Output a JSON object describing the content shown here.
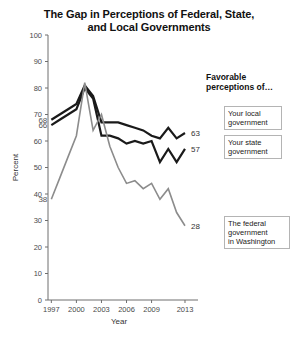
{
  "title": "The Gap in Perceptions of Federal, State, and Local Governments",
  "title_line1": "The Gap in Perceptions of Federal, State,",
  "title_line2": "and Local Governments",
  "legend": {
    "heading_line1": "Favorable",
    "heading_line2": "perceptions of…",
    "local_line1": "Your local",
    "local_line2": "government",
    "state_line1": "Your state",
    "state_line2": "government",
    "federal_line1": "The federal",
    "federal_line2": "government",
    "federal_line3": "in Washington"
  },
  "colors": {
    "local": "#1a1a1a",
    "state": "#1a1a1a",
    "federal": "#8c8c8c",
    "axis": "#6e6e6e",
    "legend_border": "#b4b4b4",
    "text": "#111111"
  },
  "annotations": {
    "start_local": "68",
    "start_state": "66",
    "start_federal": "38",
    "end_local": "63",
    "end_state": "57",
    "end_federal": "28"
  },
  "chart_data": {
    "type": "line",
    "title": "The Gap in Perceptions of Federal, State, and Local Governments",
    "xlabel": "Year",
    "ylabel": "Percent",
    "xlim": [
      1996,
      2014
    ],
    "ylim": [
      0,
      100
    ],
    "ytick_values": [
      0,
      10,
      20,
      30,
      40,
      50,
      60,
      70,
      80,
      90,
      100
    ],
    "xtick_values": [
      1997,
      2000,
      2003,
      2006,
      2009,
      2013
    ],
    "xtick_labels": [
      "1997",
      "2000",
      "2003",
      "2006",
      "2009",
      "2013"
    ],
    "grid": false,
    "legend_position": "right-callout-boxes",
    "series": [
      {
        "name": "Your local government",
        "color": "#1a1a1a",
        "start_label": "68",
        "end_label": "63",
        "x": [
          1997,
          1998,
          1999,
          2000,
          2001,
          2002,
          2003,
          2004,
          2005,
          2006,
          2007,
          2008,
          2009,
          2010,
          2011,
          2012,
          2013
        ],
        "values": [
          68,
          70,
          72,
          74,
          81,
          77,
          67,
          67,
          67,
          66,
          65,
          64,
          62,
          61,
          65,
          61,
          63
        ]
      },
      {
        "name": "Your state government",
        "color": "#1a1a1a",
        "start_label": "66",
        "end_label": "57",
        "x": [
          1997,
          1998,
          1999,
          2000,
          2001,
          2002,
          2003,
          2004,
          2005,
          2006,
          2007,
          2008,
          2009,
          2010,
          2011,
          2012,
          2013
        ],
        "values": [
          66,
          68,
          70,
          72,
          80,
          76,
          62,
          62,
          61,
          59,
          60,
          59,
          60,
          52,
          57,
          52,
          57
        ]
      },
      {
        "name": "The federal government in Washington",
        "color": "#8c8c8c",
        "start_label": "38",
        "end_label": "28",
        "x": [
          1997,
          1998,
          1999,
          2000,
          2001,
          2002,
          2003,
          2004,
          2005,
          2006,
          2007,
          2008,
          2009,
          2010,
          2011,
          2012,
          2013
        ],
        "values": [
          38,
          46,
          54,
          62,
          82,
          64,
          70,
          58,
          50,
          44,
          45,
          42,
          44,
          38,
          42,
          33,
          28
        ]
      }
    ]
  }
}
